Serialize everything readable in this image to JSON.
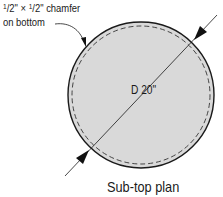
{
  "diagram": {
    "chamfer_note": {
      "size_a_num": "1",
      "size_a_den": "2",
      "size_b_num": "1",
      "size_b_den": "2",
      "line1": "1/2\" × 1/2\" chamfer",
      "line1_tail": "\" chamfer",
      "times": "\" × ",
      "slash": "/",
      "line2": "on bottom"
    },
    "dimension": "D 20\"",
    "caption": "Sub-top plan",
    "colors": {
      "fill": "#d9d9d9",
      "stroke": "#1a1a1a",
      "background": "#ffffff"
    },
    "shape": {
      "type": "circle",
      "cx": 141,
      "cy": 95,
      "r": 73,
      "inner_dashed_r": 69
    }
  }
}
